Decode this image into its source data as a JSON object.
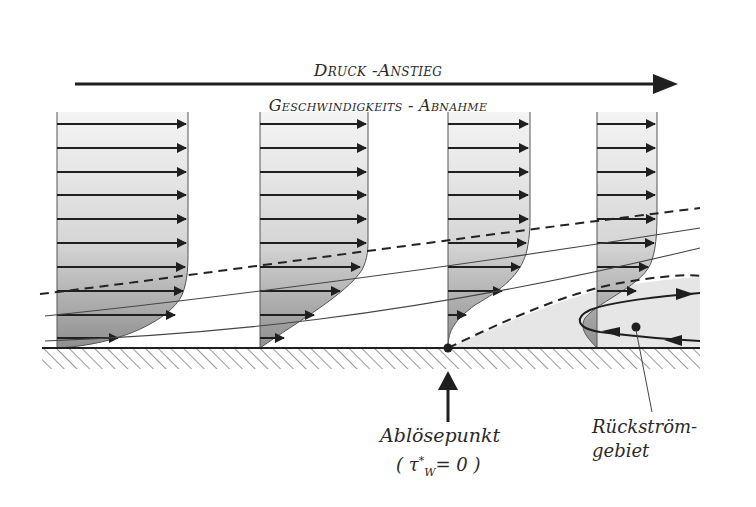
{
  "header": {
    "pressure_label": "Druck -Anstieg",
    "velocity_label": "Geschwindigkeits - Abnahme"
  },
  "annotations": {
    "separation_point": "Ablösepunkt",
    "separation_formula_open": "( ",
    "separation_formula_symbol": "τ",
    "separation_formula_sup": "*",
    "separation_formula_sub": "W",
    "separation_formula_rest": "= 0 )",
    "reverse_flow_line1": "Rückström-",
    "reverse_flow_line2": "gebiet"
  },
  "colors": {
    "ink": "#1f1f1f",
    "profile_fill_light": "#f2f2f2",
    "profile_fill_dark": "#9c9c9c",
    "recirc_fill": "#e8e8e8"
  },
  "profiles": [
    {
      "name": "profile-1",
      "x": 57,
      "right": 188
    },
    {
      "name": "profile-2",
      "x": 260,
      "right": 368
    },
    {
      "name": "profile-3-separation",
      "x": 448,
      "right": 530
    },
    {
      "name": "profile-4-reverse-flow",
      "x": 597,
      "right": 657
    }
  ]
}
